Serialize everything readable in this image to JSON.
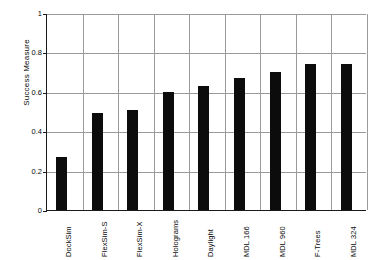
{
  "chart_data": {
    "type": "bar",
    "title": "",
    "xlabel": "",
    "ylabel": "Success Measure",
    "ylim": [
      0,
      1
    ],
    "yticks": [
      "0",
      "0.2",
      "0.4",
      "0.6",
      "0.8",
      "1"
    ],
    "ytick_values": [
      0,
      0.2,
      0.4,
      0.6,
      0.8,
      1
    ],
    "grid": true,
    "legend": false,
    "bar_color": "#0c0c0c",
    "categories": [
      "DockSim",
      "FlexSim-S",
      "FlexSim-X",
      "Holograms",
      "Daylight",
      "MDL 166",
      "MDL 960",
      "F-Trees",
      "MDL 324"
    ],
    "values": [
      0.27,
      0.49,
      0.51,
      0.6,
      0.63,
      0.67,
      0.7,
      0.74,
      0.74
    ]
  },
  "axes": {
    "y_title": "Success Measure"
  }
}
